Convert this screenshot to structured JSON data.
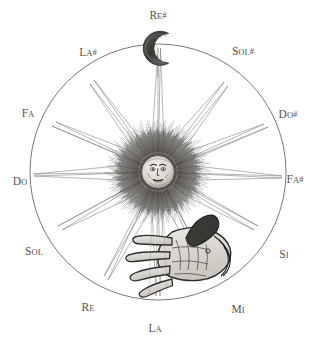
{
  "figure": {
    "kind": "chromatic-circle-engraving",
    "background_color": "#ffffff",
    "ink_color": "#55534f",
    "circle": {
      "cx": 158,
      "cy": 172,
      "r": 128,
      "stroke": "#6b6864"
    }
  },
  "center_emblem": {
    "name": "radiant-sun-with-face",
    "cx": 158,
    "cy": 172,
    "face_radius": 17,
    "corona_radius": 46,
    "ray_count": 12
  },
  "moon_emblem": {
    "name": "crescent-moon-with-face",
    "cx": 158,
    "cy": 48,
    "radius": 17
  },
  "hand_emblem": {
    "name": "engraved-open-hand",
    "cx": 178,
    "cy": 263
  },
  "chart_data": {
    "type": "pie",
    "title": "",
    "xlabel": "",
    "ylabel": "",
    "legend_position": "around-circle",
    "grid": false,
    "categories": [
      "Re#",
      "Sol#",
      "Do#",
      "Fa#",
      "Si",
      "Mi",
      "La",
      "Re",
      "Sol",
      "Do",
      "Fa",
      "La#"
    ],
    "values": [
      1,
      1,
      1,
      1,
      1,
      1,
      1,
      1,
      1,
      1,
      1,
      1
    ],
    "annotations": [
      "sun-at-center",
      "crescent-moon-at-top",
      "hand-at-lower-right"
    ]
  },
  "notes": [
    {
      "id": "re-sharp",
      "root": "Re",
      "accidental": "#",
      "angle_deg": -90,
      "label_x": 158,
      "label_y": 14,
      "anchor": "middle"
    },
    {
      "id": "sol-sharp",
      "root": "Sol",
      "accidental": "#",
      "angle_deg": -60,
      "label_x": 243,
      "label_y": 50,
      "anchor": "middle"
    },
    {
      "id": "do-sharp",
      "root": "Do",
      "accidental": "#",
      "angle_deg": -30,
      "label_x": 288,
      "label_y": 113,
      "anchor": "middle"
    },
    {
      "id": "fa-sharp",
      "root": "Fa",
      "accidental": "#",
      "angle_deg": 0,
      "label_x": 295,
      "label_y": 178,
      "anchor": "middle"
    },
    {
      "id": "si",
      "root": "Si",
      "accidental": "",
      "angle_deg": 30,
      "label_x": 284,
      "label_y": 253,
      "anchor": "middle"
    },
    {
      "id": "mi",
      "root": "Mi",
      "accidental": "",
      "angle_deg": 60,
      "label_x": 238,
      "label_y": 308,
      "anchor": "middle"
    },
    {
      "id": "la",
      "root": "La",
      "accidental": "",
      "angle_deg": 90,
      "label_x": 155,
      "label_y": 327,
      "anchor": "middle"
    },
    {
      "id": "re",
      "root": "Re",
      "accidental": "",
      "angle_deg": 120,
      "label_x": 88,
      "label_y": 306,
      "anchor": "middle"
    },
    {
      "id": "sol",
      "root": "Sol",
      "accidental": "",
      "angle_deg": 150,
      "label_x": 34,
      "label_y": 250,
      "anchor": "middle"
    },
    {
      "id": "do",
      "root": "Do",
      "accidental": "",
      "angle_deg": 180,
      "label_x": 20,
      "label_y": 180,
      "anchor": "middle"
    },
    {
      "id": "fa",
      "root": "Fa",
      "accidental": "",
      "angle_deg": -150,
      "label_x": 28,
      "label_y": 112,
      "anchor": "middle"
    },
    {
      "id": "la-sharp",
      "root": "La",
      "accidental": "#",
      "angle_deg": -120,
      "label_x": 88,
      "label_y": 51,
      "anchor": "middle"
    }
  ]
}
